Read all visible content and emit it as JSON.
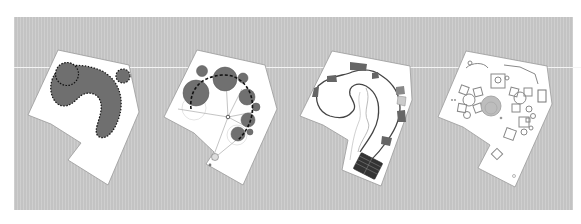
{
  "figure": {
    "background_color": "#c9c9c9",
    "site_color": "#ffffff",
    "fill_color": "#707070",
    "panels": [
      {
        "id": "zoning",
        "description": "Site plan with dotted-outline crescent zone and two circles"
      },
      {
        "id": "circle-geometry",
        "description": "Site plan with circles arranged along dashed arc and radial lines from center point"
      },
      {
        "id": "path-layout",
        "description": "Site plan with winding path loop, dark pavilions and striped deck"
      },
      {
        "id": "detailed-plan",
        "description": "Site plan with detailed furniture clusters, round plaza and small features"
      }
    ]
  }
}
